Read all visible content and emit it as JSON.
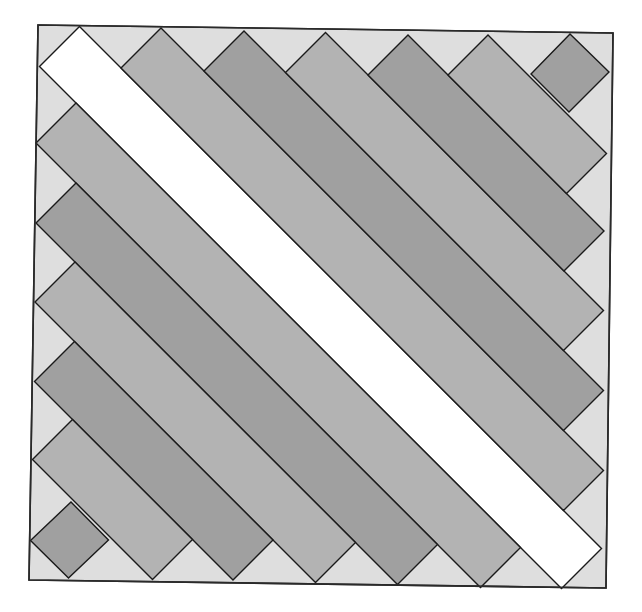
{
  "diagram": {
    "title": "Square quilt block of diagonal strips",
    "colors": {
      "page_background": "#ffffff",
      "frame_fill": "#dedede",
      "frame_stroke": "#2a2a2a",
      "strip_stroke": "#1a1a1a",
      "white_strip": "#ffffff",
      "medium_strip": "#b3b3b3",
      "dark_strip": "#a0a0a0"
    },
    "frame": {
      "points": [
        [
          38,
          25
        ],
        [
          613,
          33
        ],
        [
          606,
          588
        ],
        [
          29,
          580
        ]
      ]
    },
    "strips": [
      {
        "id": "center-white-strip",
        "tone": "white",
        "points": [
          [
            79.5,
            26.5
          ],
          [
            601.5,
            548.5
          ],
          [
            561.5,
            588.5
          ],
          [
            39.5,
            66.5
          ]
        ]
      },
      {
        "id": "upper-strip-1",
        "tone": "medium",
        "points": [
          [
            161,
            28
          ],
          [
            603.5,
            470.5
          ],
          [
            563.5,
            510.5
          ],
          [
            121,
            68
          ]
        ]
      },
      {
        "id": "upper-strip-2",
        "tone": "dark",
        "points": [
          [
            244,
            31
          ],
          [
            603.5,
            390.5
          ],
          [
            563.5,
            430.5
          ],
          [
            204,
            71
          ]
        ]
      },
      {
        "id": "upper-strip-3",
        "tone": "medium",
        "points": [
          [
            325.5,
            32.5
          ],
          [
            603.5,
            310.5
          ],
          [
            563.5,
            350.5
          ],
          [
            285.5,
            72.5
          ]
        ]
      },
      {
        "id": "upper-strip-4",
        "tone": "dark",
        "points": [
          [
            408,
            35
          ],
          [
            604,
            231
          ],
          [
            564,
            271
          ],
          [
            368,
            75
          ]
        ]
      },
      {
        "id": "upper-strip-5",
        "tone": "medium",
        "points": [
          [
            488,
            35
          ],
          [
            606.5,
            153.5
          ],
          [
            566.5,
            193.5
          ],
          [
            448,
            75
          ]
        ]
      },
      {
        "id": "upper-corner-square",
        "tone": "dark",
        "points": [
          [
            570,
            34
          ],
          [
            609,
            72
          ],
          [
            569,
            112
          ],
          [
            531,
            74
          ]
        ]
      },
      {
        "id": "lower-strip-1",
        "tone": "medium",
        "points": [
          [
            76,
            103
          ],
          [
            520.5,
            547.5
          ],
          [
            480.5,
            587.5
          ],
          [
            36,
            143
          ]
        ]
      },
      {
        "id": "lower-strip-2",
        "tone": "dark",
        "points": [
          [
            76,
            183
          ],
          [
            437.5,
            544.5
          ],
          [
            397.5,
            584.5
          ],
          [
            36,
            223
          ]
        ]
      },
      {
        "id": "lower-strip-3",
        "tone": "medium",
        "points": [
          [
            75,
            262
          ],
          [
            355.5,
            542.5
          ],
          [
            315.5,
            582.5
          ],
          [
            35,
            302
          ]
        ]
      },
      {
        "id": "lower-strip-4",
        "tone": "dark",
        "points": [
          [
            74.5,
            341.5
          ],
          [
            273,
            540
          ],
          [
            233,
            580
          ],
          [
            34.5,
            381.5
          ]
        ]
      },
      {
        "id": "lower-strip-5",
        "tone": "medium",
        "points": [
          [
            72.5,
            419.5
          ],
          [
            192.5,
            539.5
          ],
          [
            152.5,
            579.5
          ],
          [
            32.5,
            459.5
          ]
        ]
      },
      {
        "id": "lower-corner-square",
        "tone": "dark",
        "points": [
          [
            71,
            502
          ],
          [
            108.5,
            540
          ],
          [
            68.5,
            578
          ],
          [
            30.5,
            540.5
          ]
        ]
      }
    ]
  }
}
